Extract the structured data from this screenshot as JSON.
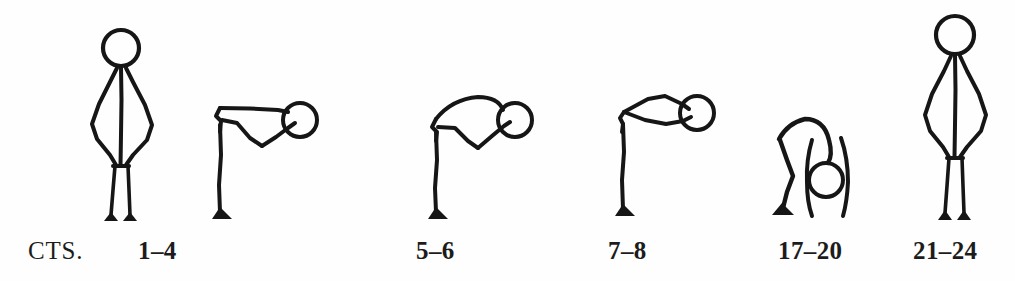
{
  "page": {
    "background_color": "#fefefe",
    "ink_color": "#161616",
    "width": 1015,
    "height": 281
  },
  "labels": {
    "row_caption": "CTS.",
    "counts": [
      {
        "text": "1–4",
        "x": 138,
        "y": 238
      },
      {
        "text": "5–6",
        "x": 416,
        "y": 238
      },
      {
        "text": "7–8",
        "x": 608,
        "y": 238
      },
      {
        "text": "17–20",
        "x": 778,
        "y": 238
      },
      {
        "text": "21–24",
        "x": 913,
        "y": 238
      }
    ],
    "caption_position": {
      "x": 28,
      "y": 238
    }
  },
  "figures": [
    {
      "name": "standing-hands-on-hips",
      "count_label": "1–4",
      "pose": "Upright standing, hands on hips, elbows flared outward",
      "head_center": {
        "x": 121,
        "y": 48
      },
      "head_radius": 18
    },
    {
      "name": "bent-forward-flat-back",
      "count_label": "1–4",
      "pose": "Torso bent ninety degrees forward, flat back, arms angled down to a point",
      "head_center": {
        "x": 300,
        "y": 120
      },
      "head_radius": 17
    },
    {
      "name": "bent-forward-arched-back",
      "count_label": "5–6",
      "pose": "Torso bent forward with arched rounded back, arms reaching down",
      "head_center": {
        "x": 515,
        "y": 120
      },
      "head_radius": 17
    },
    {
      "name": "bent-forward-arms-lens",
      "count_label": "7–8",
      "pose": "Torso bent forward, arms and back forming a pointed lens shape",
      "head_center": {
        "x": 697,
        "y": 113
      },
      "head_radius": 17
    },
    {
      "name": "deep-forward-bend-head-down",
      "count_label": "17–20",
      "pose": "Deep forward bend, knees bent, head hanging down between the arms",
      "head_center": {
        "x": 826,
        "y": 180
      },
      "head_radius": 17
    },
    {
      "name": "standing-hands-on-hips-final",
      "count_label": "21–24",
      "pose": "Return to upright standing, hands on hips, elbows flared outward",
      "head_center": {
        "x": 955,
        "y": 35
      },
      "head_radius": 19
    }
  ]
}
